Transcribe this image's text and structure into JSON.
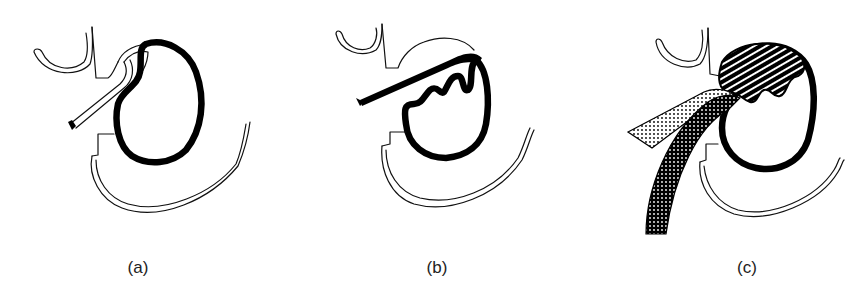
{
  "figure": {
    "panels": [
      {
        "id": "a",
        "label": "(a)"
      },
      {
        "id": "b",
        "label": "(b)"
      },
      {
        "id": "c",
        "label": "(c)"
      }
    ]
  },
  "colors": {
    "ink": "#000000",
    "background": "#ffffff",
    "caption": "#222222"
  }
}
